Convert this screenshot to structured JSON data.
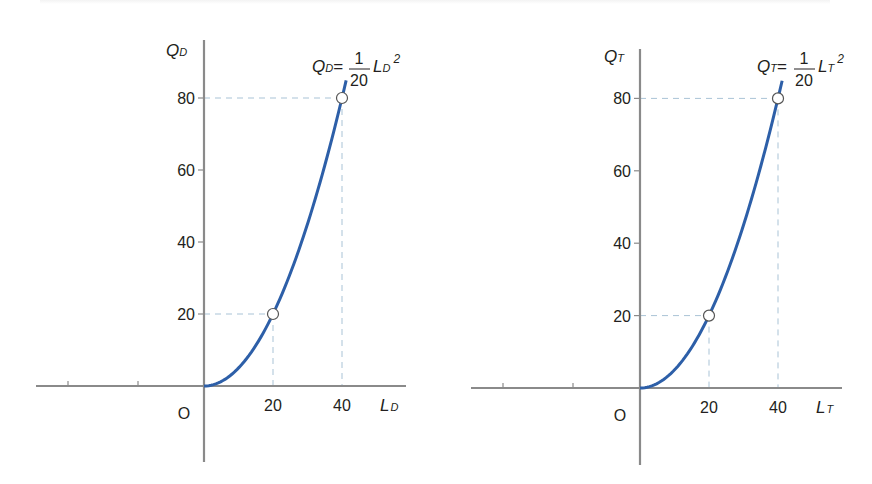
{
  "colors": {
    "axis": "#8a8a8a",
    "curve": "#2d5fa8",
    "guide": "#a9c3d6",
    "text": "#231f20",
    "marker_fill": "#ffffff",
    "marker_stroke": "#555555"
  },
  "chart_data": [
    {
      "type": "line",
      "title": "",
      "function": "Q_D = (1/20) L_D^2",
      "equation_label": {
        "lhs_var": "Q",
        "lhs_sub": "D",
        "equals": "=",
        "numerator": "1",
        "denominator": "20",
        "rhs_var": "L",
        "rhs_sub": "D",
        "exponent": "2"
      },
      "xlabel": {
        "var": "L",
        "sub": "D"
      },
      "ylabel": {
        "var": "Q",
        "sub": "D"
      },
      "origin_label": "O",
      "x_ticks": [
        20,
        40
      ],
      "x_tick_labels": [
        "20",
        "40"
      ],
      "y_ticks": [
        20,
        40,
        60,
        80
      ],
      "y_tick_labels": [
        "20",
        "40",
        "60",
        "80"
      ],
      "unlabeled_negative_x_ticks": 2,
      "xlim": [
        0,
        42
      ],
      "ylim": [
        0,
        88
      ],
      "grid": false,
      "x": [
        0,
        5,
        10,
        15,
        20,
        25,
        30,
        35,
        40,
        41.2
      ],
      "y": [
        0,
        1.25,
        5,
        11.25,
        20,
        31.25,
        45,
        61.25,
        80,
        84.9
      ],
      "highlighted_points": [
        {
          "x": 20,
          "y": 20
        },
        {
          "x": 40,
          "y": 80
        }
      ],
      "layout": {
        "ox": 204,
        "oy": 386,
        "px_per_x": 3.45,
        "px_per_y": 3.6,
        "axis_left": 36,
        "axis_right": 406,
        "axis_top": 40,
        "axis_bottom": 462,
        "neg_ticks_px": [
          68,
          138
        ],
        "eq_x": 312,
        "eq_y": 76,
        "ylabel_x": 166,
        "ylabel_y": 56
      }
    },
    {
      "type": "line",
      "title": "",
      "function": "Q_T = (1/20) L_T^2",
      "equation_label": {
        "lhs_var": "Q",
        "lhs_sub": "T",
        "equals": "=",
        "numerator": "1",
        "denominator": "20",
        "rhs_var": "L",
        "rhs_sub": "T",
        "exponent": "2"
      },
      "xlabel": {
        "var": "L",
        "sub": "T"
      },
      "ylabel": {
        "var": "Q",
        "sub": "T"
      },
      "origin_label": "O",
      "x_ticks": [
        20,
        40
      ],
      "x_tick_labels": [
        "20",
        "40"
      ],
      "y_ticks": [
        20,
        40,
        60,
        80
      ],
      "y_tick_labels": [
        "20",
        "40",
        "60",
        "80"
      ],
      "unlabeled_negative_x_ticks": 2,
      "xlim": [
        0,
        42
      ],
      "ylim": [
        0,
        88
      ],
      "grid": false,
      "x": [
        0,
        5,
        10,
        15,
        20,
        25,
        30,
        35,
        40,
        41.2
      ],
      "y": [
        0,
        1.25,
        5,
        11.25,
        20,
        31.25,
        45,
        61.25,
        80,
        84.9
      ],
      "highlighted_points": [
        {
          "x": 20,
          "y": 20
        },
        {
          "x": 40,
          "y": 80
        }
      ],
      "layout": {
        "ox": 640,
        "oy": 388,
        "px_per_x": 3.45,
        "px_per_y": 3.62,
        "axis_left": 471,
        "axis_right": 842,
        "axis_top": 49,
        "axis_bottom": 465,
        "neg_ticks_px": [
          503,
          573
        ],
        "eq_x": 757,
        "eq_y": 76,
        "ylabel_x": 604,
        "ylabel_y": 62
      }
    }
  ]
}
